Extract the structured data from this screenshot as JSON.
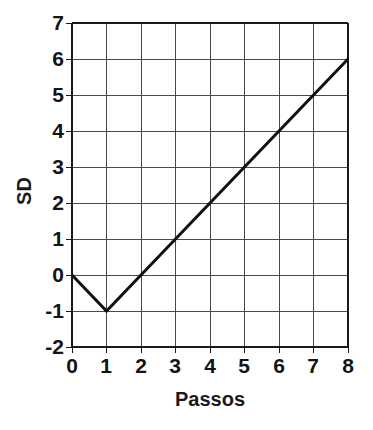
{
  "chart_data": {
    "type": "line",
    "title": "",
    "subtitle": "",
    "xlabel": "Passos",
    "ylabel": "SD",
    "x": [
      0,
      1,
      2,
      3,
      4,
      5,
      6,
      7,
      8
    ],
    "values": [
      0,
      -1,
      0,
      1,
      2,
      3,
      4,
      5,
      6
    ],
    "series": [
      {
        "name": "SD",
        "x": [
          0,
          1,
          2,
          3,
          4,
          5,
          6,
          7,
          8
        ],
        "values": [
          0,
          -1,
          0,
          1,
          2,
          3,
          4,
          5,
          6
        ]
      }
    ],
    "xlim": [
      0,
      8
    ],
    "ylim": [
      -2,
      7
    ],
    "xticks": [
      "0",
      "1",
      "2",
      "3",
      "4",
      "5",
      "6",
      "7",
      "8"
    ],
    "yticks": [
      "7",
      "6",
      "5",
      "4",
      "3",
      "2",
      "1",
      "0",
      "-1",
      "-2"
    ],
    "xtick_values": [
      0,
      1,
      2,
      3,
      4,
      5,
      6,
      7,
      8
    ],
    "ytick_values": [
      7,
      6,
      5,
      4,
      3,
      2,
      1,
      0,
      -1,
      -2
    ],
    "grid": true,
    "legend": null,
    "legend_position": "none",
    "annotations": [],
    "colors": {
      "line": "#111111",
      "grid": "#4a4a4a",
      "axis": "#1a1a1a",
      "background": "#ffffff",
      "text": "#141414"
    },
    "line_width_px": 3,
    "grid_width_px": 1
  },
  "axes": {
    "x_title": "Passos",
    "y_title": "SD"
  }
}
